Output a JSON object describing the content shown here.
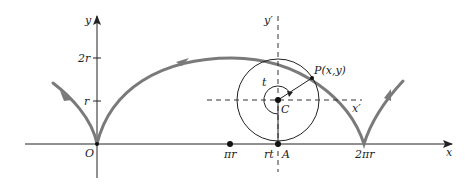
{
  "diagram": {
    "type": "cycloid",
    "colors": {
      "axis": "#222222",
      "curve": "#7a7a7a",
      "circle": "#222222",
      "dashed": "#333333"
    },
    "axes": {
      "x_label": "x",
      "y_label": "y",
      "origin_label": "O",
      "y_ticks": [
        "r",
        "2r"
      ],
      "x_ticks": [
        "πr",
        "rt",
        "2πr"
      ]
    },
    "circle": {
      "center_label": "C",
      "contact_label": "A",
      "point_label": "P(x,y)",
      "angle_label": "t",
      "local_x_label": "x′",
      "local_y_label": "y′"
    }
  }
}
